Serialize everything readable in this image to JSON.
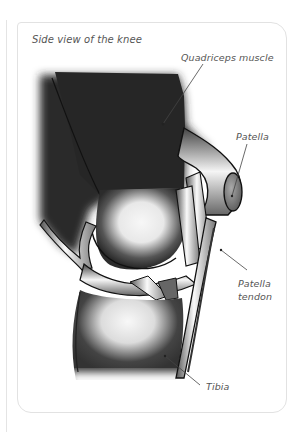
{
  "figure": {
    "title": "Side view of the knee",
    "labels": {
      "quadriceps": "Quadriceps muscle",
      "patella": "Patella",
      "tendon_line1": "Patella",
      "tendon_line2": "tendon",
      "tibia": "Tibia"
    },
    "colors": {
      "muscle": "#2b2b2b",
      "bone_light": "#f2f2f2",
      "bone_dark": "#3a3a3a",
      "outline": "#111111",
      "leader_line": "#444444",
      "card_border": "#e2e2e2",
      "label_text": "#555555"
    }
  }
}
